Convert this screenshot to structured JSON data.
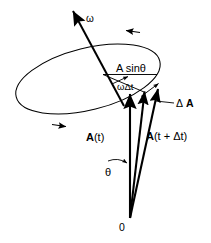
{
  "figure": {
    "background_color": "#ffffff",
    "stroke_color": "#000000",
    "width": 211,
    "height": 243
  },
  "labels": {
    "omega_axis": "ω",
    "a_sin_theta": "A sinθ",
    "omega_delta_t": "ωΔt",
    "delta_A_prefix": "Δ",
    "delta_A_vector": "A",
    "vector_At_bold": "A",
    "vector_At_rest": "(t)",
    "vector_Atdt_bold": "A",
    "vector_Atdt_rest": "(t + Δt)",
    "theta": "θ",
    "origin": "0"
  },
  "geometry": {
    "origin_point": [
      130,
      218
    ],
    "tip_At": [
      146,
      89
    ],
    "tip_Atdt": [
      159,
      86
    ],
    "axis_arrow_tip": [
      72,
      10
    ],
    "axis_base": [
      122,
      103
    ],
    "vertical_axis_tip": [
      130,
      92
    ],
    "ellipse_center": [
      88,
      79
    ],
    "ellipse_rx": 74,
    "ellipse_ry": 31,
    "ellipse_rotation_deg": -14,
    "a_sin_theta_line": [
      [
        104,
        74
      ],
      [
        156,
        74
      ]
    ]
  },
  "elements": {
    "ellipse_name": "precession-circle",
    "ellipse_arrow_top": "ellipse-direction-arrow-top",
    "ellipse_arrow_bottom": "ellipse-direction-arrow-bottom",
    "axis_name": "rotation-axis-omega",
    "vector_at_name": "vector-A-of-t",
    "vector_atdt_name": "vector-A-of-t-plus-delta-t",
    "delta_vector_name": "vector-delta-A",
    "radius_line_name": "radius-line-A-sin-theta",
    "theta_arc_name": "angle-arc-theta",
    "omega_dt_arc_name": "angle-arc-omega-delta-t"
  }
}
